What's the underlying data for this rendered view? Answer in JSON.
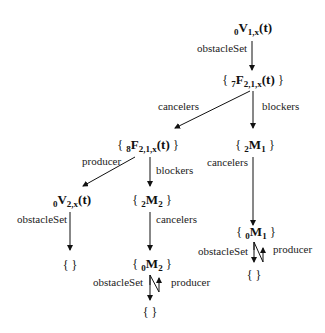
{
  "nodes": {
    "v1": {
      "pre": "0",
      "main": "V",
      "sub": "1,x",
      "suffix": "(t)",
      "braced": false
    },
    "f7": {
      "pre": "7",
      "main": "F",
      "sub": "2,1,x",
      "suffix": "(t)",
      "braced": true
    },
    "f8": {
      "pre": "8",
      "main": "F",
      "sub": "2,1,x",
      "suffix": "(t)",
      "braced": true
    },
    "m1_2": {
      "pre": "2",
      "main": "M",
      "sub": "1",
      "suffix": "",
      "braced": true
    },
    "v2": {
      "pre": "0",
      "main": "V",
      "sub": "2,x",
      "suffix": "(t)",
      "braced": false
    },
    "m2_2": {
      "pre": "2",
      "main": "M",
      "sub": "2",
      "suffix": "",
      "braced": true
    },
    "m1_0": {
      "pre": "0",
      "main": "M",
      "sub": "1",
      "suffix": "",
      "braced": true
    },
    "empty_v2": {
      "text": "{ }"
    },
    "m2_0": {
      "pre": "0",
      "main": "M",
      "sub": "2",
      "suffix": "",
      "braced": true
    },
    "empty_m1": {
      "text": "{ }"
    },
    "empty_m2": {
      "text": "{ }"
    }
  },
  "braces": {
    "open": "{",
    "close": "}"
  },
  "edges": {
    "v1_f7": "obstacleSet",
    "f7_f8": "cancelers",
    "f7_m1": "blockers",
    "f8_v2": "producer",
    "f8_m2": "blockers",
    "m1_m1_0": "cancelers",
    "v2_empty": "obstacleSet",
    "m2_m2_0": "cancelers",
    "m1_0_empty": "obstacleSet",
    "m1_0_producer": "producer",
    "m2_0_empty": "obstacleSet",
    "m2_0_producer": "producer"
  }
}
